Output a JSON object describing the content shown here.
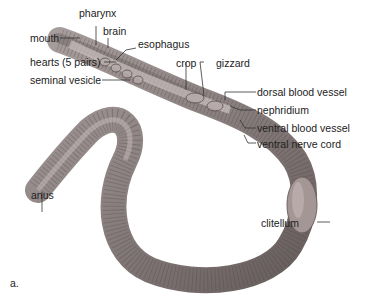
{
  "figure": {
    "panel_label": "a.",
    "labels": {
      "pharynx": "pharynx",
      "brain": "brain",
      "mouth": "mouth",
      "esophagus": "esophagus",
      "hearts": "hearts (5 pairs)",
      "crop": "crop",
      "gizzard": "gizzard",
      "seminal_vesicle": "seminal vesicle",
      "dorsal_blood_vessel": "dorsal blood vessel",
      "nephridium": "nephridium",
      "ventral_blood_vessel": "ventral blood vessel",
      "ventral_nerve_cord": "ventral nerve cord",
      "anus": "anus",
      "clitellum": "clitellum"
    },
    "colors": {
      "worm_body": "#8a7f7f",
      "worm_dark": "#5e5454",
      "worm_light": "#b8adad",
      "clitellum": "#a39494",
      "leader_line": "#333333",
      "text": "#222222"
    }
  }
}
